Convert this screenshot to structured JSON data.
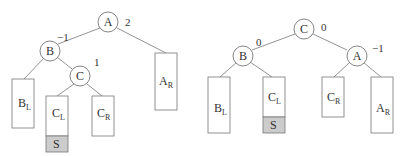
{
  "colors": {
    "stroke": "#666666",
    "fill": "#ffffff",
    "highlight_fill": "#cccccc",
    "text": "#333333"
  },
  "left_tree": {
    "nodes": {
      "A": {
        "label": "A",
        "balance": "2"
      },
      "B": {
        "label": "B",
        "balance": "−1"
      },
      "C": {
        "label": "C",
        "balance": "1"
      }
    },
    "subtrees": {
      "B_L": {
        "main": "B",
        "sub": "L"
      },
      "C_L": {
        "main": "C",
        "sub": "L"
      },
      "C_R": {
        "main": "C",
        "sub": "R"
      },
      "A_R": {
        "main": "A",
        "sub": "R"
      },
      "S": {
        "label": "S"
      }
    }
  },
  "right_tree": {
    "nodes": {
      "C": {
        "label": "C",
        "balance": "0"
      },
      "B": {
        "label": "B",
        "balance": "0"
      },
      "A": {
        "label": "A",
        "balance": "−1"
      }
    },
    "subtrees": {
      "B_L": {
        "main": "B",
        "sub": "L"
      },
      "C_L": {
        "main": "C",
        "sub": "L"
      },
      "C_R": {
        "main": "C",
        "sub": "R"
      },
      "A_R": {
        "main": "A",
        "sub": "R"
      },
      "S": {
        "label": "S"
      }
    }
  }
}
